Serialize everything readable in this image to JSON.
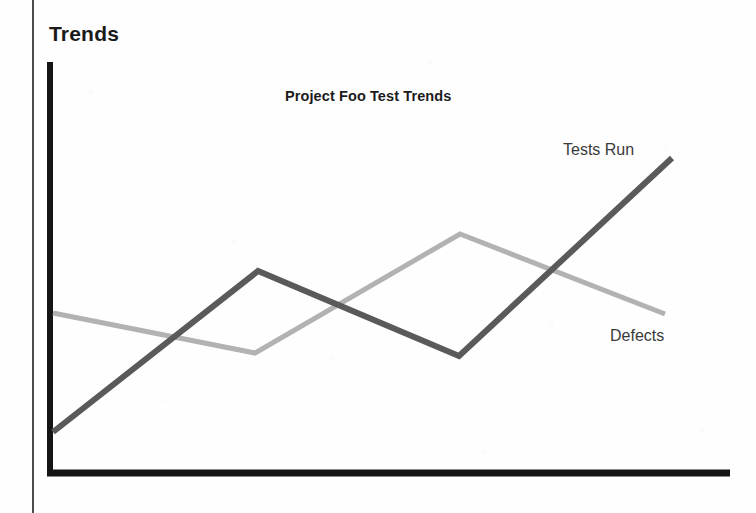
{
  "page": {
    "section_heading": "Trends",
    "background_color": "#fefefe",
    "margin_rule_color": "#4c4c4c"
  },
  "chart_data": {
    "type": "line",
    "title": "Project Foo Test Trends",
    "xlabel": "",
    "ylabel": "",
    "grid": false,
    "legend_position": "inline-end-of-line",
    "axis_color": "#151515",
    "axes": {
      "y_axis": {
        "x": 50,
        "y_top": 62,
        "y_bottom": 473,
        "width": 6
      },
      "x_axis": {
        "y": 473,
        "x_left": 47,
        "x_right": 730,
        "height": 7
      }
    },
    "x": [
      0,
      1,
      2,
      3
    ],
    "series": [
      {
        "name": "Tests Run",
        "color": "#5a5a5a",
        "stroke_width": 6,
        "values": [
          1,
          5.8,
          3.1,
          9.4
        ],
        "points": [
          {
            "x": 53,
            "y": 432
          },
          {
            "x": 258,
            "y": 271
          },
          {
            "x": 459,
            "y": 356
          },
          {
            "x": 672,
            "y": 158
          }
        ],
        "label": "Tests Run"
      },
      {
        "name": "Defects",
        "color": "#b2b2b2",
        "stroke_width": 5,
        "values": [
          5.2,
          3.6,
          7.4,
          4.9
        ],
        "points": [
          {
            "x": 53,
            "y": 313
          },
          {
            "x": 255,
            "y": 353
          },
          {
            "x": 460,
            "y": 234
          },
          {
            "x": 665,
            "y": 314
          }
        ],
        "label": "Defects"
      }
    ]
  }
}
